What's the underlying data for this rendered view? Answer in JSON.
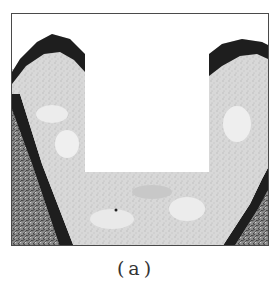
{
  "figure": {
    "colors": {
      "frame": "#4a4a4a",
      "bone_light": "#e6e6e6",
      "bone_mid": "#cfcfcf",
      "dark_layer": "#1e1e1e",
      "soft_tissue": "#9a9a9a",
      "cutout": "#ffffff"
    }
  },
  "caption": {
    "text": "(a)"
  }
}
